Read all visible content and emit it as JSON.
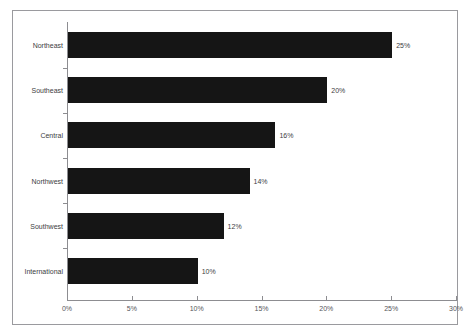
{
  "chart_data": {
    "type": "bar",
    "orientation": "horizontal",
    "title": "",
    "xlabel": "",
    "ylabel": "",
    "categories": [
      "Northeast",
      "Southeast",
      "Central",
      "Northwest",
      "Southwest",
      "International"
    ],
    "values": [
      25,
      20,
      16,
      14,
      12,
      10
    ],
    "value_labels": [
      "25%",
      "20%",
      "16%",
      "14%",
      "12%",
      "10%"
    ],
    "xlim": [
      0,
      30
    ],
    "xticks": [
      0,
      5,
      10,
      15,
      20,
      25,
      30
    ],
    "xtick_labels": [
      "0%",
      "5%",
      "10%",
      "15%",
      "20%",
      "25%",
      "30%"
    ],
    "grid": false,
    "legend": false,
    "bar_color": "#151515",
    "axis_color": "#8d8d91",
    "text_color": "#3d3d42",
    "background": "#ffffff"
  }
}
